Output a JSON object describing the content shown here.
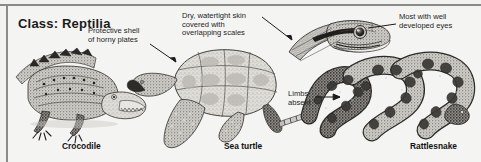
{
  "figure": {
    "title": "Class: Reptilia",
    "background_color": "#f2f2f0",
    "rule_color": "#8a8a88",
    "ink_color": "#1e1e1e"
  },
  "annotations": [
    {
      "id": "protective-shell",
      "text": "Protective shell\nof horny plates",
      "points_to": "sea-turtle-shell"
    },
    {
      "id": "dry-skin",
      "text": "Dry, watertight skin\ncovered with\noverlapping scales",
      "points_to": "snake-head-scales"
    },
    {
      "id": "developed-eyes",
      "text": "Most with well\ndeveloped eyes",
      "points_to": "snake-eye"
    },
    {
      "id": "limbs-absent",
      "text": "Limbs\nabsent",
      "points_to": "rattlesnake-body"
    }
  ],
  "specimens": [
    {
      "id": "crocodile",
      "caption": "Crocodile"
    },
    {
      "id": "sea-turtle",
      "caption": "Sea turtle"
    },
    {
      "id": "rattlesnake",
      "caption": "Rattlesnake"
    }
  ]
}
